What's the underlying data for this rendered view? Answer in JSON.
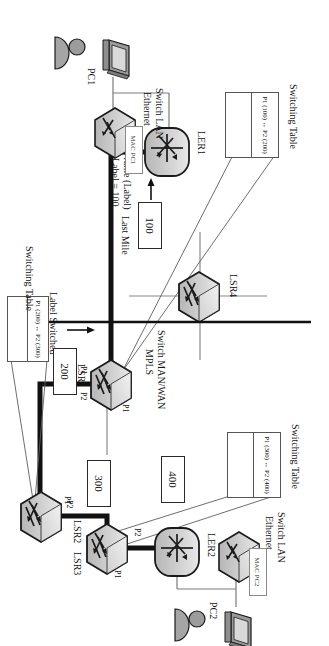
{
  "diagram": {
    "nodes": {
      "ler2": "LER2",
      "lsr3": "LSR3",
      "lsr4": "LSR4",
      "lsr2": "LSR2",
      "lsr1": "LSR1",
      "ler1": "LER1",
      "pc1": "PC1",
      "pc2": "PC2"
    },
    "zone_labels": {
      "lan_top_line1": "Switch LAN",
      "lan_top_line2": "Ethernet",
      "lan_bottom_line1": "Switch LAN",
      "lan_bottom_line2": "Ethernet",
      "wan_line1": "Switch MAN/WAN",
      "wan_line2": "MPLS"
    },
    "mac_boxes": {
      "pc2": "MAC PC2",
      "pc1": "MAC PC1"
    },
    "frame_labels": {
      "l400": "400",
      "l300": "300",
      "l200": "200",
      "l100": "100"
    },
    "annotations": {
      "last_mile": "Last Mile",
      "frame_label_line1": "Frame (Label)",
      "frame_label_line2": "Label = 100",
      "lsp_line1": "Label Switched",
      "lsp_line2": "Path (LSP)"
    },
    "ports": {
      "lsr3_p2": "P2",
      "lsr3_p1": "P1",
      "lsr2_p2": "P2",
      "lsr2_p1": "P1",
      "lsr1_p1": "P1",
      "lsr1_p2": "P2"
    },
    "switching_tables": [
      {
        "title": "Switching Table",
        "rows": [
          "P1 (300) ↔ P2 (400)",
          ""
        ]
      },
      {
        "title": "Switching Table",
        "rows": [
          "P1 (200) ↔ P2 (300)",
          ""
        ]
      },
      {
        "title": "Switching Table",
        "rows": [
          "P1 (100) ↔ P2 (200)",
          ""
        ]
      }
    ],
    "colors": {
      "lsp_path": "#111111",
      "thin_link": "#6f6f6f",
      "device_fill": "#c9c9c9",
      "device_stroke": "#1a1a1a",
      "table_stroke": "#555555"
    }
  }
}
